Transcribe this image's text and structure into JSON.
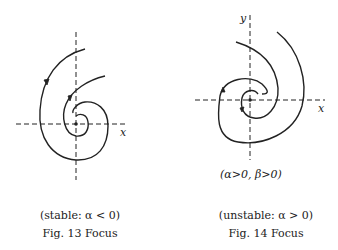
{
  "figures": [
    {
      "id": "fig13",
      "subtitle": "(stable: α < 0)",
      "caption": "Fig. 13   Focus",
      "axis_labels": {
        "x": "x"
      },
      "description": "stable focus: trajectories spiral inward toward origin"
    },
    {
      "id": "fig14",
      "condition": "(α>0, β>0)",
      "subtitle": "(unstable: α > 0)",
      "caption": "Fig. 14   Focus",
      "axis_labels": {
        "x": "x",
        "y": "y"
      },
      "description": "unstable focus: trajectories spiral outward from origin"
    }
  ],
  "colors": {
    "stroke": "#222222",
    "background": "#ffffff"
  }
}
